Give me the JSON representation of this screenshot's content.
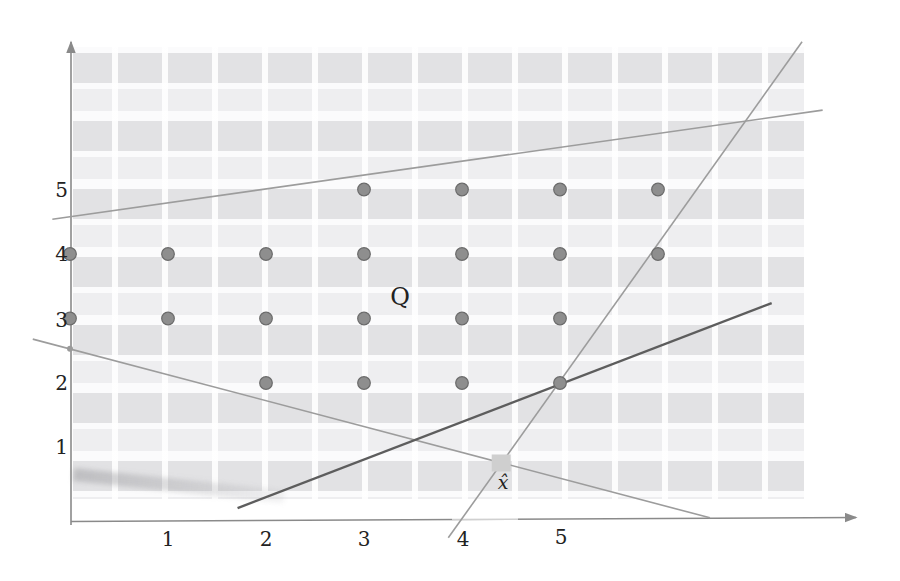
{
  "figure": {
    "colors": {
      "tile": "#e2e2e4",
      "tile_faint": "#eeeef0",
      "line_light": "#9c9c9c",
      "line_dark": "#5d5d5d",
      "axis": "#8a8a8a",
      "dot_fill": "#8e8e8e",
      "dot_stroke": "#6b6b6b",
      "square": "#cfcfcf",
      "text": "#222222"
    }
  },
  "chart_data": {
    "type": "scatter",
    "title": "",
    "xlabel": "",
    "ylabel": "",
    "grid": false,
    "xlim": [
      -0.7,
      8.1
    ],
    "ylim": [
      -1.1,
      7.4
    ],
    "x_tick_labels": [
      "1",
      "2",
      "3",
      "4",
      "5"
    ],
    "y_tick_labels": [
      "1",
      "2",
      "3",
      "4",
      "5"
    ],
    "region_label": "Q",
    "xhat_label": "x̂",
    "integer_points": [
      [
        3,
        5
      ],
      [
        4,
        5
      ],
      [
        5,
        5
      ],
      [
        6,
        5
      ],
      [
        0,
        4
      ],
      [
        1,
        4
      ],
      [
        2,
        4
      ],
      [
        3,
        4
      ],
      [
        4,
        4
      ],
      [
        5,
        4
      ],
      [
        6,
        4
      ],
      [
        0,
        3
      ],
      [
        1,
        3
      ],
      [
        2,
        3
      ],
      [
        3,
        3
      ],
      [
        4,
        3
      ],
      [
        5,
        3
      ],
      [
        2,
        2
      ],
      [
        3,
        2
      ],
      [
        4,
        2
      ],
      [
        5,
        2
      ]
    ],
    "boundary_lines": [
      {
        "name": "upper-constraint-line",
        "style": "light",
        "from": [
          -0.18,
          4.54
        ],
        "to": [
          7.68,
          6.23
        ]
      },
      {
        "name": "right-constraint-line",
        "style": "light",
        "from": [
          3.86,
          -0.4
        ],
        "to": [
          7.47,
          7.29
        ]
      },
      {
        "name": "lower-constraint-line",
        "style": "light",
        "from": [
          -0.38,
          2.68
        ],
        "to": [
          6.53,
          -0.09
        ]
      },
      {
        "name": "cut-line",
        "style": "dark",
        "from": [
          1.71,
          0.06
        ],
        "to": [
          7.16,
          3.24
        ]
      }
    ],
    "xhat_point": [
      4.4,
      0.76
    ],
    "y_axis_vertex_point": [
      0,
      2.53
    ]
  }
}
